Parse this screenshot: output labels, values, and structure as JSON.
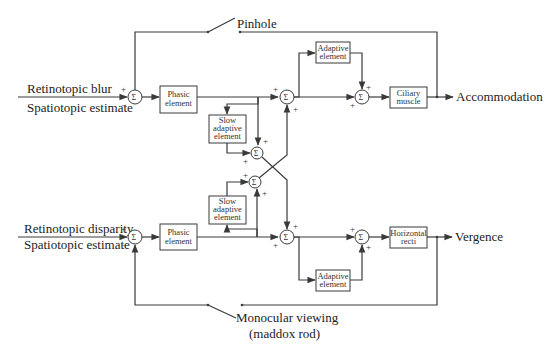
{
  "diagram": {
    "type": "block-diagram",
    "inputs": {
      "top": {
        "line1": "Retinotopic blur",
        "line2": "Spatiotopic estimate"
      },
      "bottom": {
        "line1": "Retinotopic disparity",
        "line2": "Spatiotopic estimate"
      }
    },
    "outputs": {
      "top": "Accommodation",
      "bottom": "Vergence"
    },
    "switches": {
      "top": "Pinhole",
      "bottom_line1": "Monocular viewing",
      "bottom_line2": "(maddox rod)"
    },
    "blocks": {
      "phasic_top": {
        "line1": "Phasic",
        "line2": "element"
      },
      "phasic_bottom": {
        "line1": "Phasic",
        "line2": "element"
      },
      "slow_top": {
        "line1": "Slow",
        "line2": "adaptive",
        "line3": "element"
      },
      "slow_bottom": {
        "line1": "Slow",
        "line2": "adaptive",
        "line3": "element"
      },
      "adaptive_top": {
        "line1": "Adaptive",
        "line2": "element"
      },
      "adaptive_bottom": {
        "line1": "Adaptive",
        "line2": "element"
      },
      "ciliary": {
        "line1": "Ciliary",
        "line2": "muscle"
      },
      "recti": {
        "line1": "Horizontal",
        "line2": "recti"
      }
    },
    "symbols": {
      "sigma": "Σ",
      "plus": "+",
      "minus": "−"
    }
  }
}
